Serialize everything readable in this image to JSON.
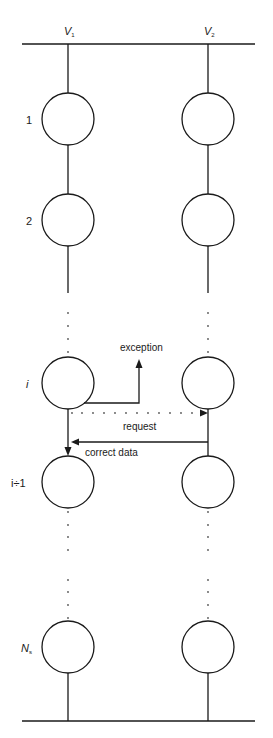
{
  "diagram": {
    "columns": [
      {
        "id": "V1",
        "label": "V",
        "subscript": "1",
        "x": 68
      },
      {
        "id": "V2",
        "label": "V",
        "subscript": "2",
        "x": 208
      }
    ],
    "rows": [
      {
        "label": "1",
        "y": 119
      },
      {
        "label": "2",
        "y": 220
      },
      {
        "label": "i",
        "y": 383
      },
      {
        "label": "i÷1",
        "y": 482
      },
      {
        "label": "N",
        "subscript": "s",
        "y": 647
      }
    ],
    "annotations": {
      "exception": "exception",
      "request": "request",
      "correct_data": "correct data"
    },
    "colors": {
      "stroke": "#1a1a1a",
      "background": "#ffffff"
    }
  }
}
